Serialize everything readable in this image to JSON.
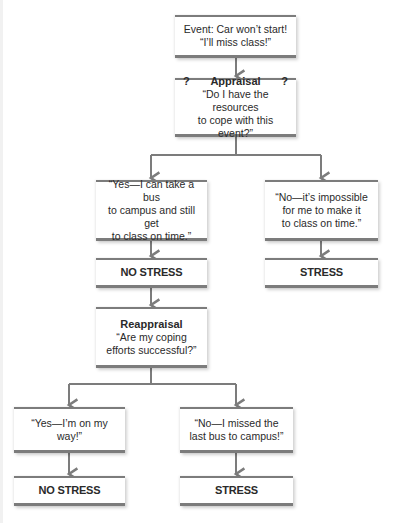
{
  "diagram": {
    "type": "flowchart",
    "colors": {
      "connector": "#7c7c7c",
      "box_border": "#7c7c7c",
      "text": "#2a2a2a"
    },
    "nodes": {
      "event": {
        "lines": [
          "Event: Car won’t start!",
          "“I’ll miss class!”"
        ]
      },
      "appraisal": {
        "marker_left": "?",
        "title": "Appraisal",
        "marker_right": "?",
        "lines": [
          "“Do I have the resources",
          "to cope with this event?”"
        ]
      },
      "yes_1": {
        "lines": [
          "“Yes—I can take a bus",
          "to campus and still get",
          "to class on time.”"
        ]
      },
      "no_1": {
        "lines": [
          "“No—it’s impossible",
          "for me to make it",
          "to class on time.”"
        ]
      },
      "outcome_no_stress_1": {
        "label": "NO STRESS"
      },
      "outcome_stress_1": {
        "label": "STRESS"
      },
      "reappraisal": {
        "title": "Reappraisal",
        "lines": [
          "“Are my coping",
          "efforts successful?”"
        ]
      },
      "yes_2": {
        "lines": [
          "“Yes—I’m on my way!”"
        ]
      },
      "no_2": {
        "lines": [
          "“No—I missed the",
          "last bus to campus!”"
        ]
      },
      "outcome_no_stress_2": {
        "label": "NO STRESS"
      },
      "outcome_stress_2": {
        "label": "STRESS"
      }
    },
    "edges": [
      [
        "event",
        "appraisal"
      ],
      [
        "appraisal",
        "yes_1"
      ],
      [
        "appraisal",
        "no_1"
      ],
      [
        "yes_1",
        "outcome_no_stress_1"
      ],
      [
        "no_1",
        "outcome_stress_1"
      ],
      [
        "outcome_no_stress_1",
        "reappraisal"
      ],
      [
        "reappraisal",
        "yes_2"
      ],
      [
        "reappraisal",
        "no_2"
      ],
      [
        "yes_2",
        "outcome_no_stress_2"
      ],
      [
        "no_2",
        "outcome_stress_2"
      ]
    ]
  }
}
